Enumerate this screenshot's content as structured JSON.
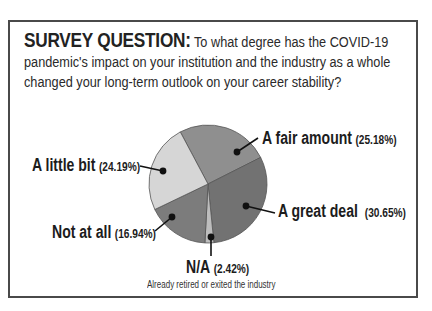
{
  "survey": {
    "lead": "SURVEY QUESTION:",
    "question": " To what degree has the COVID-19 pandemic's impact on your institution and the industry as a whole changed your long-term outlook on your career stability?"
  },
  "labels": {
    "fair": {
      "name": "A fair amount",
      "pct": "(25.18%)"
    },
    "great": {
      "name": "A great deal",
      "pct": "(30.65%)"
    },
    "na": {
      "name": "N/A",
      "pct": "(2.42%)",
      "note": "Already retired or exited the industry"
    },
    "notatall": {
      "name": "Not at all",
      "pct": "(16.94%)"
    },
    "little": {
      "name": "A little bit",
      "pct": "(24.19%)"
    }
  },
  "chart_data": {
    "type": "pie",
    "title": "SURVEY QUESTION: To what degree has the COVID-19 pandemic's impact on your institution and the industry as a whole changed your long-term outlook on your career stability?",
    "categories": [
      "A fair amount",
      "A great deal",
      "N/A",
      "Not at all",
      "A little bit"
    ],
    "values": [
      25.18,
      30.65,
      2.42,
      16.94,
      24.19
    ],
    "colors": [
      "#8f8f8f",
      "#727272",
      "#bdbdbd",
      "#7c7c7c",
      "#d6d6d6"
    ],
    "start_angle_deg": -28,
    "direction": "clockwise",
    "annotations": [
      "N/A: Already retired or exited the industry"
    ],
    "legend": "none (direct labels with leader lines)"
  }
}
